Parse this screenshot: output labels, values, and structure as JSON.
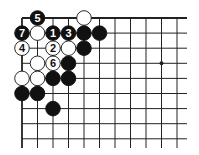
{
  "diagram": {
    "type": "go-board-fragment",
    "corner": "top-left",
    "grid": {
      "origin_x": 22,
      "origin_y": 18,
      "step_x": 15.5,
      "step_y": 15.1,
      "cols": 11,
      "rows": 9,
      "extend_right_to": 187,
      "extend_bottom_to": 148
    },
    "colors": {
      "line": "#222222",
      "black_stone": "#111111",
      "white_stone": "#ffffff",
      "stone_outline": "#111111"
    },
    "star_points": [
      {
        "col": 9,
        "row": 3
      }
    ],
    "stones": [
      {
        "col": 1,
        "row": 0,
        "color": "black",
        "label": "5"
      },
      {
        "col": 4,
        "row": 0,
        "color": "white",
        "label": ""
      },
      {
        "col": 0,
        "row": 1,
        "color": "black",
        "label": "7"
      },
      {
        "col": 1,
        "row": 1,
        "color": "white",
        "label": ""
      },
      {
        "col": 2,
        "row": 1,
        "color": "black",
        "label": "1"
      },
      {
        "col": 3,
        "row": 1,
        "color": "black",
        "label": "3"
      },
      {
        "col": 4,
        "row": 1,
        "color": "black",
        "label": ""
      },
      {
        "col": 5,
        "row": 1,
        "color": "black",
        "label": ""
      },
      {
        "col": 0,
        "row": 2,
        "color": "white",
        "label": "4"
      },
      {
        "col": 2,
        "row": 2,
        "color": "white",
        "label": "2"
      },
      {
        "col": 3,
        "row": 2,
        "color": "white",
        "label": ""
      },
      {
        "col": 4,
        "row": 2,
        "color": "black",
        "label": ""
      },
      {
        "col": 1,
        "row": 3,
        "color": "white",
        "label": ""
      },
      {
        "col": 2,
        "row": 3,
        "color": "white",
        "label": "6"
      },
      {
        "col": 3,
        "row": 3,
        "color": "black",
        "label": ""
      },
      {
        "col": 0,
        "row": 4,
        "color": "white",
        "label": ""
      },
      {
        "col": 1,
        "row": 4,
        "color": "white",
        "label": ""
      },
      {
        "col": 2,
        "row": 4,
        "color": "black",
        "label": ""
      },
      {
        "col": 3,
        "row": 4,
        "color": "black",
        "label": ""
      },
      {
        "col": 0,
        "row": 5,
        "color": "black",
        "label": ""
      },
      {
        "col": 1,
        "row": 5,
        "color": "black",
        "label": ""
      },
      {
        "col": 2,
        "row": 6,
        "color": "black",
        "label": ""
      }
    ]
  }
}
